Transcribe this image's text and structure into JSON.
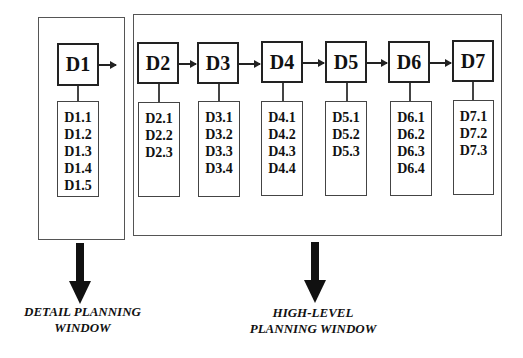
{
  "diagram": {
    "detail_window": {
      "node": {
        "label": "D1",
        "items": [
          "D1.1",
          "D1.2",
          "D1.3",
          "D1.4",
          "D1.5"
        ]
      },
      "caption": [
        "DETAIL PLANNING",
        "WINDOW"
      ]
    },
    "high_level_window": {
      "nodes": [
        {
          "label": "D2",
          "items": [
            "D2.1",
            "D2.2",
            "D2.3"
          ]
        },
        {
          "label": "D3",
          "items": [
            "D3.1",
            "D3.2",
            "D3.3",
            "D3.4"
          ]
        },
        {
          "label": "D4",
          "items": [
            "D4.1",
            "D4.2",
            "D4.3",
            "D4.4"
          ]
        },
        {
          "label": "D5",
          "items": [
            "D5.1",
            "D5.2",
            "D5.3"
          ]
        },
        {
          "label": "D6",
          "items": [
            "D6.1",
            "D6.2",
            "D6.3",
            "D6.4"
          ]
        },
        {
          "label": "D7",
          "items": [
            "D7.1",
            "D7.2",
            "D7.3"
          ]
        }
      ],
      "caption": [
        "HIGH-LEVEL",
        "PLANNING WINDOW"
      ]
    },
    "flow": [
      "D1",
      "D2",
      "D3",
      "D4",
      "D5",
      "D6",
      "D7"
    ]
  }
}
